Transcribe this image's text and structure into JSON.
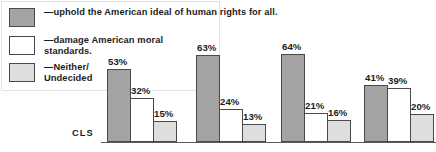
{
  "legend": {
    "items": [
      {
        "label": "—uphold the American ideal of human rights for all.",
        "swatch": "dark-gray-swatch",
        "color": "#a3a3a3"
      },
      {
        "label": "—damage American moral\n  standards.",
        "swatch": "white-swatch",
        "color": "#ffffff"
      },
      {
        "label": "—Neither/\n  Undecided",
        "swatch": "light-gray-swatch",
        "color": "#dedede"
      }
    ]
  },
  "axis_tag": "CLS",
  "chart_data": {
    "type": "bar",
    "title": "",
    "xlabel": "",
    "ylabel": "",
    "ylim": [
      0,
      70
    ],
    "grid": false,
    "legend_position": "top-left",
    "categories": [
      "CLS",
      "Group 2",
      "Group 3",
      "Group 4"
    ],
    "series": [
      {
        "name": "—uphold the American ideal of human rights for all.",
        "color": "#a3a3a3",
        "values": [
          53,
          63,
          64,
          41
        ]
      },
      {
        "name": "—damage American moral standards.",
        "color": "#ffffff",
        "values": [
          32,
          24,
          21,
          39
        ]
      },
      {
        "name": "—Neither/ Undecided",
        "color": "#dedede",
        "values": [
          15,
          13,
          16,
          20
        ]
      }
    ],
    "data_labels": [
      [
        "53%",
        "32%",
        "15%"
      ],
      [
        "63%",
        "24%",
        "13%"
      ],
      [
        "64%",
        "21%",
        "16%"
      ],
      [
        "41%",
        "39%",
        "20%"
      ]
    ]
  },
  "geometry": {
    "baseline_y": 142,
    "bar_width": 24,
    "px_per_unit": 1.38,
    "group_left": [
      107,
      196,
      281,
      364
    ]
  }
}
